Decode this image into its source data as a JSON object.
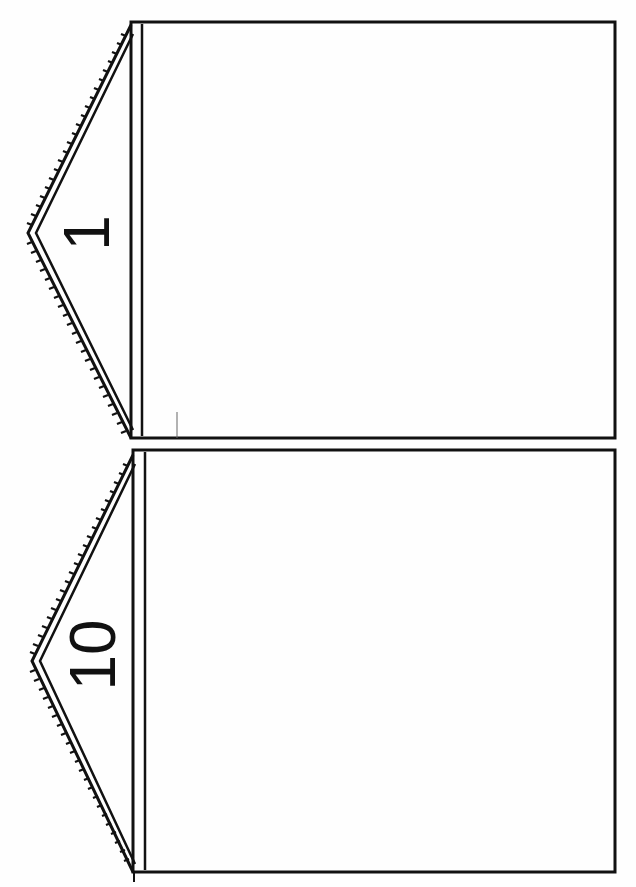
{
  "document": {
    "type": "printable-template",
    "orientation": "rotated-90",
    "stroke_color": "#111111",
    "background_color": "#fefefe"
  },
  "frames": [
    {
      "label": "1",
      "shape": "house-pentagon",
      "roof_style": "double-line-with-serrated-edge"
    },
    {
      "label": "10",
      "shape": "house-pentagon",
      "roof_style": "double-line-with-serrated-edge"
    }
  ]
}
